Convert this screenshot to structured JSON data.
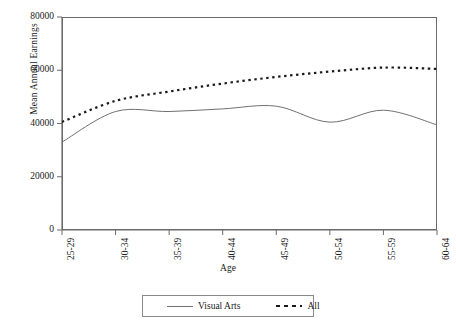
{
  "chart_data": {
    "type": "line",
    "title": "",
    "xlabel": "Age",
    "ylabel": "Mean Annual Earnings",
    "categories": [
      "25-29",
      "30-34",
      "35-39",
      "40-44",
      "45-49",
      "50-54",
      "55-59",
      "60-64"
    ],
    "ylim": [
      0,
      80000
    ],
    "yticks": [
      0,
      20000,
      40000,
      60000,
      80000
    ],
    "ytick_labels": [
      "0",
      "20000",
      "40000",
      "60000",
      "80000"
    ],
    "grid": false,
    "legend_position": "bottom",
    "series": [
      {
        "name": "Visual Arts",
        "style": "solid",
        "color": "#707070",
        "values": [
          33000,
          44500,
          44500,
          45500,
          46500,
          40500,
          45000,
          39500
        ]
      },
      {
        "name": "All",
        "style": "dashed",
        "color": "#1a1a1a",
        "values": [
          40600,
          48500,
          52000,
          55000,
          57500,
          59500,
          61000,
          60500
        ]
      }
    ]
  },
  "legend": {
    "items": [
      {
        "label": "Visual Arts",
        "sample": "solid-line-sample"
      },
      {
        "label": "All",
        "sample": "dashed-line-sample"
      }
    ]
  },
  "axes": {
    "y_title": "Mean Annual Earnings",
    "x_title": "Age"
  }
}
